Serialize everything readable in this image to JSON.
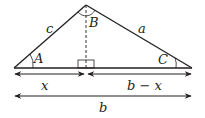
{
  "diagram": {
    "type": "triangle-altitude",
    "vertices": {
      "A": {
        "label": "A"
      },
      "B": {
        "label": "B"
      },
      "C": {
        "label": "C"
      }
    },
    "sides": {
      "c": {
        "label": "c",
        "between": [
          "A",
          "B"
        ]
      },
      "a": {
        "label": "a",
        "between": [
          "B",
          "C"
        ]
      },
      "b": {
        "label": "b",
        "between": [
          "A",
          "C"
        ]
      }
    },
    "segments": {
      "x": {
        "label": "x"
      },
      "b_minus_x": {
        "label": "b − x"
      },
      "b": {
        "label": "b"
      }
    },
    "colors": {
      "stroke": "#231f20"
    }
  }
}
